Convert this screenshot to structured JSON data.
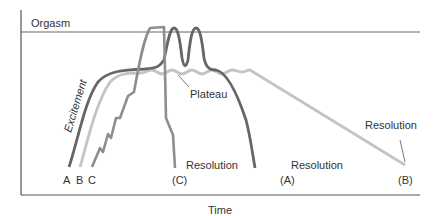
{
  "diagram": {
    "y_axis_level_label": "Orgasm",
    "x_axis_label": "Time",
    "phase_labels": {
      "excitement": "Excitement",
      "plateau": "Plateau"
    },
    "curve_start_labels": [
      "A",
      "B",
      "C"
    ],
    "resolution_labels": {
      "c": "Resolution",
      "a": "Resolution",
      "b": "Resolution"
    },
    "curve_end_labels": {
      "c": "(C)",
      "a": "(A)",
      "b": "(B)"
    },
    "colors": {
      "axis": "#555555",
      "curve_a": "#666666",
      "curve_b": "#c4c4c4",
      "curve_c": "#8e8e8e",
      "text": "#333333"
    }
  }
}
